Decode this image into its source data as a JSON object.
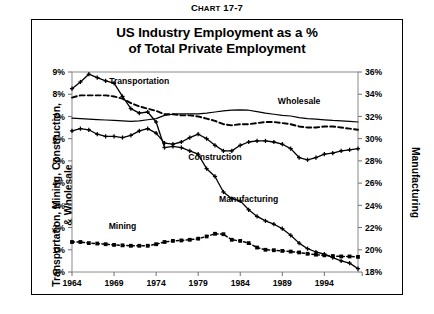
{
  "caption": {
    "prefix": "C",
    "smallcaps": "HART",
    "number": " 17-7"
  },
  "title": {
    "line1": "US Industry Employment as a %",
    "line2": "of Total Private Employment"
  },
  "axis_titles": {
    "left": "Transportation, Mining, Construction, & Wholesale",
    "right": "Manufacturing"
  },
  "chart_data": {
    "type": "line",
    "title": "US Industry Employment as a % of Total Private Employment",
    "subtitle": "Chart 17-7",
    "xlabel": "",
    "ylabel": "Transportation, Mining, Construction, & Wholesale",
    "y2label": "Manufacturing",
    "grid": false,
    "legend": "inline-annotations",
    "xlim": [
      1964,
      1998
    ],
    "ylim": [
      0,
      9
    ],
    "y2lim": [
      18,
      36
    ],
    "xticks": [
      1964,
      1969,
      1974,
      1979,
      1984,
      1989,
      1994
    ],
    "xtick_labels": [
      "1964",
      "1969",
      "1974",
      "1979",
      "1984",
      "1989",
      "1994"
    ],
    "yticks": [
      0,
      1,
      2,
      3,
      4,
      5,
      6,
      7,
      8,
      9
    ],
    "ytick_labels": [
      "0%",
      "1%",
      "2%",
      "3%",
      "4%",
      "5%",
      "6%",
      "7%",
      "8%",
      "9%"
    ],
    "y2ticks": [
      18,
      20,
      22,
      24,
      26,
      28,
      30,
      32,
      34,
      36
    ],
    "y2tick_labels": [
      "18%",
      "20%",
      "22%",
      "24%",
      "26%",
      "28%",
      "30%",
      "32%",
      "34%",
      "36%"
    ],
    "x": [
      1964,
      1965,
      1966,
      1967,
      1968,
      1969,
      1970,
      1971,
      1972,
      1973,
      1974,
      1975,
      1976,
      1977,
      1978,
      1979,
      1980,
      1981,
      1982,
      1983,
      1984,
      1985,
      1986,
      1987,
      1988,
      1989,
      1990,
      1991,
      1992,
      1993,
      1994,
      1995,
      1996,
      1997,
      1998
    ],
    "series": [
      {
        "name": "Manufacturing",
        "axis": "right",
        "style": "solid-with-plus-markers",
        "label_x": 1985,
        "label_y": 3.15,
        "values": [
          34.5,
          35.1,
          35.8,
          35.5,
          35.2,
          35.0,
          33.8,
          32.7,
          32.3,
          32.4,
          31.5,
          29.2,
          29.3,
          29.2,
          28.9,
          28.6,
          27.3,
          26.6,
          25.2,
          24.6,
          24.4,
          23.6,
          23.0,
          22.6,
          22.3,
          21.9,
          21.3,
          20.6,
          20.1,
          19.8,
          19.6,
          19.3,
          19.0,
          18.8,
          18.3
        ]
      },
      {
        "name": "Transportation",
        "axis": "left",
        "style": "dashed",
        "label_x": 1972,
        "label_y": 8.45,
        "values": [
          7.85,
          7.95,
          7.95,
          7.95,
          7.95,
          7.9,
          7.8,
          7.6,
          7.45,
          7.35,
          7.25,
          7.1,
          7.1,
          7.05,
          7.05,
          7.0,
          6.9,
          6.8,
          6.65,
          6.6,
          6.65,
          6.65,
          6.7,
          6.75,
          6.75,
          6.7,
          6.65,
          6.55,
          6.5,
          6.5,
          6.55,
          6.55,
          6.5,
          6.45,
          6.4
        ]
      },
      {
        "name": "Wholesale",
        "axis": "left",
        "style": "solid-thin",
        "label_x": 1991,
        "label_y": 7.55,
        "values": [
          6.92,
          6.9,
          6.88,
          6.86,
          6.84,
          6.82,
          6.8,
          6.78,
          6.8,
          6.85,
          6.9,
          7.05,
          7.1,
          7.12,
          7.12,
          7.12,
          7.15,
          7.2,
          7.25,
          7.28,
          7.3,
          7.28,
          7.22,
          7.15,
          7.1,
          7.05,
          7.02,
          6.95,
          6.9,
          6.88,
          6.85,
          6.82,
          6.8,
          6.78,
          6.75
        ]
      },
      {
        "name": "Construction",
        "axis": "left",
        "style": "solid-with-plus-markers",
        "label_x": 1981,
        "label_y": 5.05,
        "values": [
          6.35,
          6.45,
          6.4,
          6.2,
          6.1,
          6.1,
          6.05,
          6.15,
          6.35,
          6.45,
          6.25,
          5.8,
          5.75,
          5.85,
          6.05,
          6.2,
          6.0,
          5.7,
          5.45,
          5.45,
          5.7,
          5.85,
          5.9,
          5.9,
          5.85,
          5.75,
          5.55,
          5.15,
          5.05,
          5.15,
          5.3,
          5.35,
          5.45,
          5.5,
          5.55
        ]
      },
      {
        "name": "Mining",
        "axis": "left",
        "style": "dotted-with-square-markers",
        "label_x": 1970,
        "label_y": 1.95,
        "values": [
          1.35,
          1.35,
          1.3,
          1.28,
          1.25,
          1.22,
          1.2,
          1.18,
          1.18,
          1.18,
          1.25,
          1.35,
          1.4,
          1.42,
          1.45,
          1.5,
          1.6,
          1.72,
          1.7,
          1.45,
          1.4,
          1.3,
          1.1,
          1.0,
          0.98,
          0.95,
          0.92,
          0.88,
          0.82,
          0.78,
          0.75,
          0.72,
          0.7,
          0.7,
          0.68
        ]
      }
    ]
  }
}
